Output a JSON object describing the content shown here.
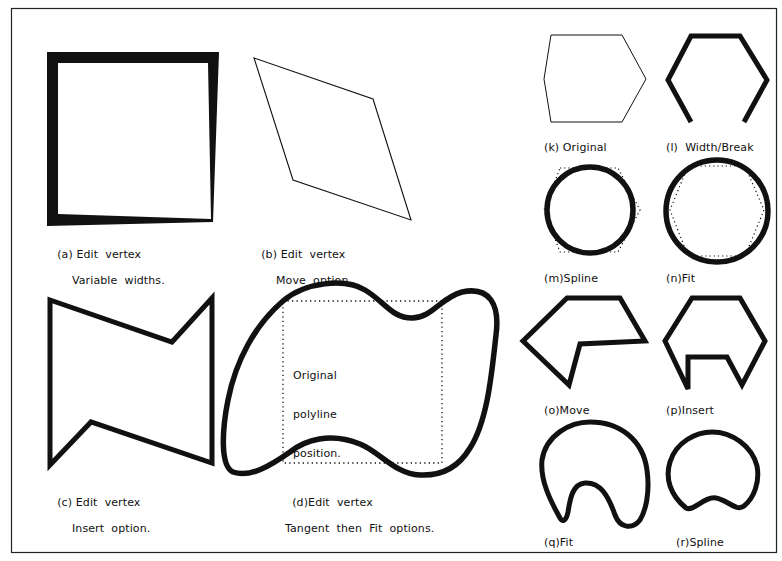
{
  "figure": {
    "frame_color": "#222222",
    "stroke_color": "#111111",
    "background": "#ffffff"
  },
  "panels": {
    "a": {
      "label": "(a)",
      "line1": "Edit  vertex",
      "line2": "Variable  widths."
    },
    "b": {
      "label": "(b)",
      "line1": "Edit  vertex",
      "line2": "Move  option."
    },
    "c": {
      "label": "(c)",
      "line1": "Edit  vertex",
      "line2": "Insert  option."
    },
    "d": {
      "label": "(d)",
      "line1": "Edit  vertex",
      "line2": "Tangent  then  Fit  options.",
      "inner_note": [
        "Original",
        "polyline",
        "position."
      ]
    },
    "k": {
      "caption": "(k) Original"
    },
    "l": {
      "caption": "(l)  Width/Break"
    },
    "m": {
      "caption": "(m)Spline"
    },
    "n": {
      "caption": "(n)Fit"
    },
    "o": {
      "caption": "(o)Move"
    },
    "p": {
      "caption": "(p)Insert"
    },
    "q": {
      "caption": "(q)Fit"
    },
    "r": {
      "caption": "(r)Spline"
    }
  }
}
